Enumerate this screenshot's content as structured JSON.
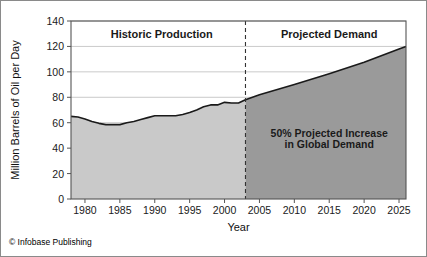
{
  "figure": {
    "credit": "© Infobase Publishing",
    "background_color": "#ffffff",
    "border_color": "#8a8a8a"
  },
  "chart_data": {
    "type": "area",
    "title": "",
    "xlabel": "Year",
    "ylabel": "Million Barrels of Oil per Day",
    "xlim": [
      1978,
      2026
    ],
    "ylim": [
      0,
      140
    ],
    "yticks": [
      0,
      20,
      40,
      60,
      80,
      100,
      120,
      140
    ],
    "ytick_labels": [
      "0",
      "20",
      "40",
      "60",
      "80",
      "100",
      "120",
      "140"
    ],
    "xticks": [
      1980,
      1985,
      1990,
      1995,
      2000,
      2005,
      2010,
      2015,
      2020,
      2025
    ],
    "xtick_labels": [
      "1980",
      "1985",
      "1990",
      "1995",
      "2000",
      "2005",
      "2010",
      "2015",
      "2020",
      "2025"
    ],
    "grid": true,
    "grid_axis": "y",
    "legend": "none",
    "series": [
      {
        "name": "Historic Production",
        "fill_color": "#c9c9c9",
        "line_color": "#1a1a1a",
        "x": [
          1978,
          1979,
          1980,
          1981,
          1982,
          1983,
          1984,
          1985,
          1986,
          1987,
          1988,
          1989,
          1990,
          1991,
          1992,
          1993,
          1994,
          1995,
          1996,
          1997,
          1998,
          1999,
          2000,
          2001,
          2002,
          2003
        ],
        "values": [
          65,
          64.5,
          63,
          61,
          59.5,
          58.5,
          58.5,
          58.5,
          60,
          61,
          62.5,
          64,
          65.5,
          65.5,
          65.5,
          65.5,
          66.5,
          68,
          70,
          72.5,
          74,
          74,
          76,
          75.5,
          75.5,
          78
        ]
      },
      {
        "name": "Projected Demand",
        "fill_color": "#9a9a9a",
        "line_color": "#1a1a1a",
        "x": [
          2003,
          2005,
          2010,
          2015,
          2020,
          2025,
          2026
        ],
        "values": [
          78,
          82,
          90,
          98.5,
          107.5,
          118,
          120
        ]
      }
    ],
    "divider": {
      "x": 2003,
      "style": "dashed",
      "color": "#333333"
    },
    "region_labels": [
      {
        "text": "Historic Production",
        "x": 1991,
        "y": 130
      },
      {
        "text": "Projected Demand",
        "x": 2015,
        "y": 130
      }
    ],
    "annotations": [
      {
        "text": "50% Projected Increase",
        "x": 2015,
        "y": 52
      },
      {
        "text": "in Global Demand",
        "x": 2015,
        "y": 43
      }
    ]
  }
}
